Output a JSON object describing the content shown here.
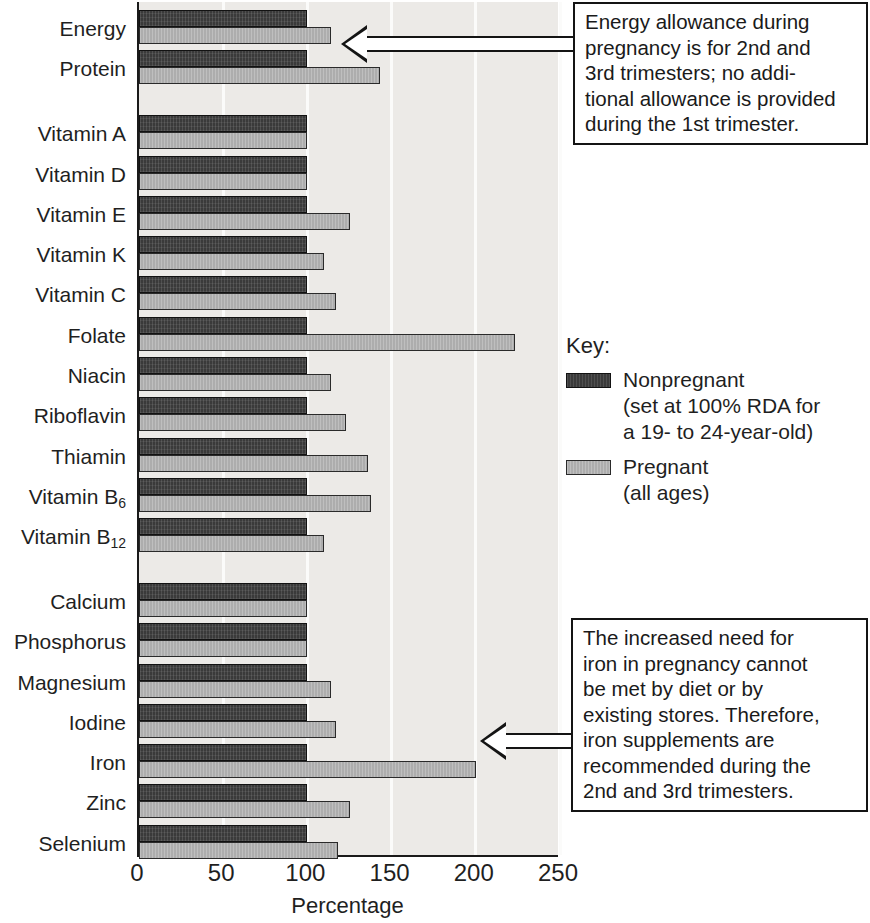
{
  "chart_data": {
    "type": "bar",
    "orientation": "horizontal",
    "title": "",
    "xlabel": "Percentage",
    "ylabel": "",
    "xlim": [
      0,
      250
    ],
    "xticks": [
      0,
      50,
      100,
      150,
      200,
      250
    ],
    "grid": true,
    "grid_axis": "x",
    "legend_position": "right",
    "categories": [
      "Energy",
      "Protein",
      "Vitamin A",
      "Vitamin D",
      "Vitamin E",
      "Vitamin K",
      "Vitamin C",
      "Folate",
      "Niacin",
      "Riboflavin",
      "Thiamin",
      "Vitamin B6",
      "Vitamin B12",
      "Calcium",
      "Phosphorus",
      "Magnesium",
      "Iodine",
      "Iron",
      "Zinc",
      "Selenium"
    ],
    "series": [
      {
        "name": "Nonpregnant",
        "color": "#3a3a3a",
        "values": [
          100,
          100,
          100,
          100,
          100,
          100,
          100,
          100,
          100,
          100,
          100,
          100,
          100,
          100,
          100,
          100,
          100,
          100,
          100,
          100
        ]
      },
      {
        "name": "Pregnant",
        "color": "#adadad",
        "values": [
          114,
          143,
          100,
          100,
          125,
          110,
          117,
          223,
          114,
          123,
          136,
          138,
          110,
          100,
          100,
          114,
          117,
          200,
          125,
          118
        ]
      }
    ],
    "group_gaps_after": [
      "Protein",
      "Vitamin B12"
    ]
  },
  "axis": {
    "x_title": "Percentage",
    "ticks": [
      "0",
      "50",
      "100",
      "150",
      "200",
      "250"
    ]
  },
  "categories": [
    {
      "label": "Energy",
      "sub": ""
    },
    {
      "label": "Protein",
      "sub": ""
    },
    {
      "label": "Vitamin A",
      "sub": ""
    },
    {
      "label": "Vitamin D",
      "sub": ""
    },
    {
      "label": "Vitamin E",
      "sub": ""
    },
    {
      "label": "Vitamin K",
      "sub": ""
    },
    {
      "label": "Vitamin C",
      "sub": ""
    },
    {
      "label": "Folate",
      "sub": ""
    },
    {
      "label": "Niacin",
      "sub": ""
    },
    {
      "label": "Riboflavin",
      "sub": ""
    },
    {
      "label": "Thiamin",
      "sub": ""
    },
    {
      "label": "Vitamin B",
      "sub": "6"
    },
    {
      "label": "Vitamin B",
      "sub": "12"
    },
    {
      "label": "Calcium",
      "sub": ""
    },
    {
      "label": "Phosphorus",
      "sub": ""
    },
    {
      "label": "Magnesium",
      "sub": ""
    },
    {
      "label": "Iodine",
      "sub": ""
    },
    {
      "label": "Iron",
      "sub": ""
    },
    {
      "label": "Zinc",
      "sub": ""
    },
    {
      "label": "Selenium",
      "sub": ""
    }
  ],
  "legend": {
    "title": "Key:",
    "entries": [
      {
        "name": "Nonpregnant",
        "detail": "(set at 100% RDA for\na 19- to 24-year-old)",
        "color": "#3a3a3a"
      },
      {
        "name": "Pregnant",
        "detail": "(all ages)",
        "color": "#adadad"
      }
    ]
  },
  "callouts": {
    "top": {
      "text": "Energy allowance during\npregnancy is for 2nd and\n3rd trimesters; no addi-\ntional allowance is provided\nduring the 1st trimester.",
      "points_to": "Energy"
    },
    "bottom": {
      "text": "The increased need for\niron in pregnancy cannot\nbe met by diet or by\nexisting stores. Therefore,\niron supplements are\nrecommended during the\n2nd and 3rd trimesters.",
      "points_to": "Iron"
    }
  }
}
